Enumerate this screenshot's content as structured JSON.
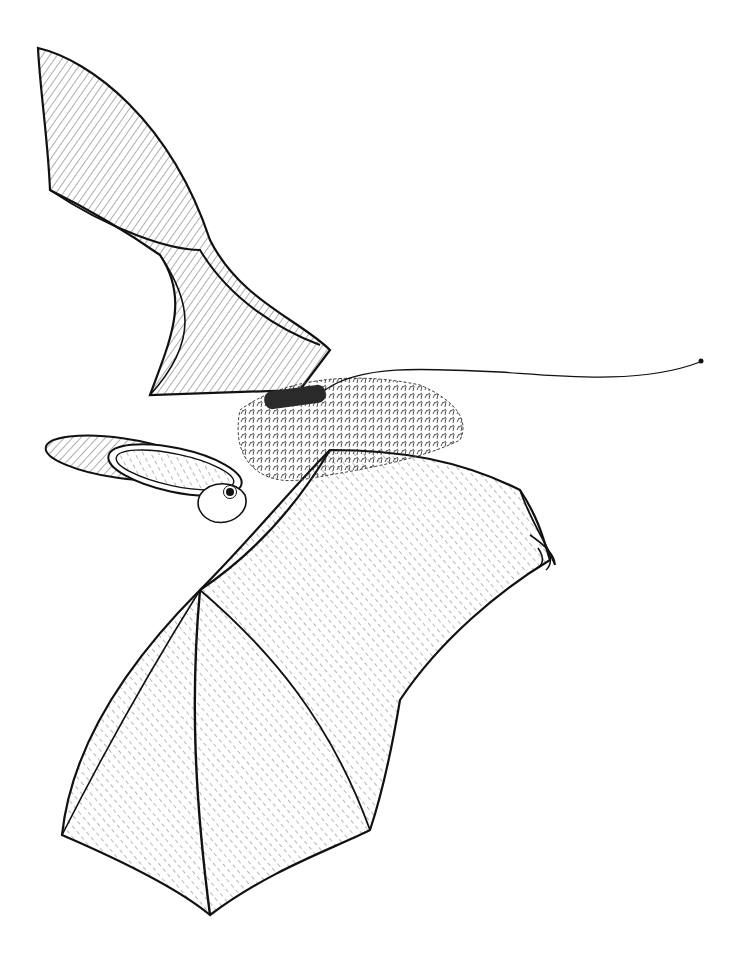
{
  "image": {
    "subject": "Pen-and-ink illustration of a long-eared bat in flight carrying a radio transmitter with trailing antenna",
    "background_color": "#ffffff",
    "ink_color": "#1a1a1a"
  }
}
